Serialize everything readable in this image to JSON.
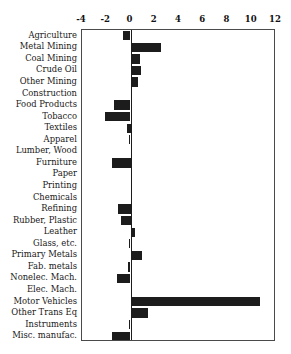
{
  "chart_data": {
    "type": "bar",
    "orientation": "horizontal",
    "title": "",
    "subtitle": "",
    "xlabel": "",
    "ylabel": "",
    "xlim": [
      -4,
      12
    ],
    "ylim": null,
    "grid": false,
    "legend": null,
    "bar_color": "#1c1c1c",
    "frame_color": "#4a4a4a",
    "axis_position": "top",
    "xticks": [
      -4,
      -2,
      0,
      2,
      4,
      6,
      8,
      10,
      12
    ],
    "xticklabels": [
      "-4",
      "-2",
      "0",
      "2",
      "4",
      "6",
      "8",
      "10",
      "12"
    ],
    "categories": [
      "Agriculture",
      "Metal Mining",
      "Coal Mining",
      "Crude Oil",
      "Other Mining",
      "Construction",
      "Food Products",
      "Tobacco",
      "Textiles",
      "Apparel",
      "Lumber, Wood",
      "Furniture",
      "Paper",
      "Printing",
      "Chemicals",
      "Refining",
      "Rubber, Plastic",
      "Leather",
      "Glass, etc.",
      "Primary Metals",
      "Fab. metals",
      "Nonelec. Mach.",
      "Elec. Mach.",
      "Motor Vehicles",
      "Other Trans Eq",
      "Instruments",
      "Misc. manufac."
    ],
    "values": [
      -0.65,
      2.55,
      0.75,
      0.85,
      0.6,
      0.0,
      -1.4,
      -2.1,
      -0.25,
      -0.1,
      0.15,
      -1.5,
      0.05,
      0.0,
      0.1,
      -1.0,
      -0.75,
      0.35,
      -0.15,
      0.95,
      -0.2,
      -1.1,
      0.0,
      10.7,
      1.45,
      -0.15,
      -1.55
    ]
  }
}
